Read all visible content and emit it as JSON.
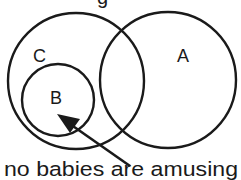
{
  "diagram": {
    "type": "venn",
    "sets": [
      {
        "id": "C",
        "label": "C",
        "cx": 76,
        "cy": 81,
        "r": 68
      },
      {
        "id": "A",
        "label": "A",
        "cx": 168,
        "cy": 80,
        "r": 68
      },
      {
        "id": "B",
        "label": "B",
        "cx": 58,
        "cy": 100,
        "r": 36
      }
    ],
    "labels": {
      "C": "C",
      "A": "A",
      "B": "B"
    },
    "caption": "no babies are amusing",
    "top_partial_text": "g",
    "colors": {
      "stroke": "#1a1a1a",
      "background": "#ffffff"
    }
  }
}
